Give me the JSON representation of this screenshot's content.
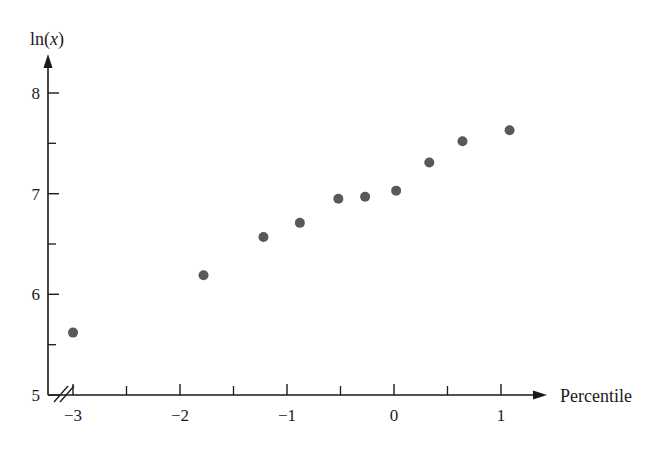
{
  "chart_data": {
    "type": "scatter",
    "title": "",
    "subtitle": "",
    "xlabel": "Percentile",
    "ylabel": "ln(x)",
    "ylabel_parts": {
      "prefix": "ln(",
      "variable": "x",
      "suffix": ")"
    },
    "xlim": [
      -3.3,
      1.35
    ],
    "ylim": [
      5.0,
      8.35
    ],
    "x_major_ticks": [
      -3,
      -2,
      -1,
      0,
      1
    ],
    "x_major_tick_labels": [
      "−3",
      "−2",
      "−1",
      "0",
      "1"
    ],
    "x_minor_ticks": [
      -2.5,
      -1.5,
      -0.5,
      0.5
    ],
    "y_major_ticks": [
      5,
      6,
      7,
      8
    ],
    "y_major_tick_labels": [
      "5",
      "6",
      "7",
      "8"
    ],
    "y_minor_ticks": [
      5.5,
      6.5,
      7.5
    ],
    "grid": false,
    "legend": null,
    "axis_break": {
      "present": true,
      "axis": "x",
      "near": "origin",
      "style": "double-slash"
    },
    "marker": {
      "shape": "circle",
      "color": "#595959",
      "radius_px": 5
    },
    "points": [
      {
        "x": -3.0,
        "y": 5.62
      },
      {
        "x": -1.78,
        "y": 6.19
      },
      {
        "x": -1.22,
        "y": 6.57
      },
      {
        "x": -0.88,
        "y": 6.71
      },
      {
        "x": -0.52,
        "y": 6.95
      },
      {
        "x": -0.27,
        "y": 6.97
      },
      {
        "x": 0.02,
        "y": 7.03
      },
      {
        "x": 0.33,
        "y": 7.31
      },
      {
        "x": 0.64,
        "y": 7.52
      },
      {
        "x": 1.08,
        "y": 7.63
      }
    ],
    "series": [
      {
        "name": "ln(x) vs Percentile",
        "x": [
          -3.0,
          -1.78,
          -1.22,
          -0.88,
          -0.52,
          -0.27,
          0.02,
          0.33,
          0.64,
          1.08
        ],
        "values": [
          5.62,
          6.19,
          6.57,
          6.71,
          6.95,
          6.97,
          7.03,
          7.31,
          7.52,
          7.63
        ]
      }
    ]
  }
}
